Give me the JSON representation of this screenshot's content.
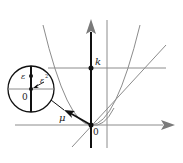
{
  "diagram": {
    "labels": {
      "k": "k",
      "origin": "0",
      "mu": "μ",
      "epsilon": "ε",
      "epsilon_sq": "ε",
      "epsilon_sq_exp": "2",
      "inset_origin": "0"
    },
    "colors": {
      "axis_main": "#111111",
      "gray_lines": "#8c8c8c",
      "arrow_gray": "#7a7a7a",
      "circle": "#111111"
    }
  }
}
